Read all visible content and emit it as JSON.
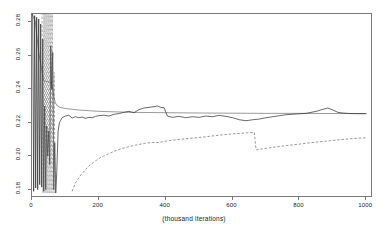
{
  "figure": {
    "background": "#ffffff",
    "frame_color": "#7a7a7a"
  },
  "chart_data": {
    "type": "line",
    "title": "",
    "subtitle": "",
    "xlabel": "(thousand iterations)",
    "ylabel": "",
    "xlim": [
      0,
      1020
    ],
    "ylim": [
      0.175,
      0.285
    ],
    "grid": false,
    "legend": null,
    "xticks": [
      0,
      200,
      400,
      600,
      800,
      1000
    ],
    "xtick_labels": [
      "0",
      "200",
      "400",
      "600",
      "800",
      "1000"
    ],
    "yticks": [
      0.18,
      0.2,
      0.22,
      0.24,
      0.26,
      0.28
    ],
    "ytick_labels": [
      "0.18",
      "0.20",
      "0.22",
      "0.24",
      "0.26",
      "0.28"
    ],
    "series": [
      {
        "name": "reference-level",
        "style": "solid",
        "color": "#555555",
        "width": 0.6,
        "description": "flat horizontal reference trace settling near 0.2255",
        "x": [
          0,
          10,
          20,
          28,
          34,
          40,
          46,
          52,
          58,
          62,
          66,
          70,
          76,
          84,
          92,
          100,
          140,
          200,
          300,
          400,
          500,
          600,
          700,
          800,
          900,
          1000
        ],
        "y": [
          0.285,
          0.2805,
          0.262,
          0.253,
          0.2455,
          0.2448,
          0.2445,
          0.2442,
          0.244,
          0.24,
          0.235,
          0.2318,
          0.23,
          0.2292,
          0.2288,
          0.2285,
          0.2276,
          0.2268,
          0.2262,
          0.226,
          0.2258,
          0.2257,
          0.2256,
          0.2256,
          0.2255,
          0.2255
        ]
      },
      {
        "name": "noisy-upper-chain",
        "style": "solid-jagged",
        "color": "#2a2a2a",
        "width": 0.7,
        "description": "highly oscillatory chain, burn-in spikes before x=70, rising to plateau ~0.2255 with bumps near 370 and 880",
        "x": [
          2,
          5,
          8,
          11,
          14,
          17,
          20,
          23,
          26,
          29,
          32,
          35,
          38,
          41,
          44,
          47,
          50,
          53,
          56,
          59,
          62,
          65,
          68,
          71,
          74,
          78,
          82,
          86,
          90,
          95,
          100,
          110,
          120,
          130,
          140,
          150,
          160,
          170,
          180,
          190,
          200,
          215,
          230,
          245,
          260,
          275,
          290,
          305,
          320,
          335,
          350,
          365,
          375,
          385,
          395,
          405,
          420,
          440,
          460,
          480,
          500,
          520,
          540,
          560,
          580,
          600,
          620,
          640,
          660,
          680,
          700,
          720,
          740,
          760,
          790,
          820,
          850,
          870,
          885,
          900,
          915,
          930,
          950,
          970,
          1000
        ],
        "y": [
          0.286,
          0.179,
          0.284,
          0.181,
          0.283,
          0.18,
          0.282,
          0.183,
          0.279,
          0.1815,
          0.27,
          0.179,
          0.23,
          0.18,
          0.218,
          0.2,
          0.215,
          0.195,
          0.266,
          0.24,
          0.262,
          0.18,
          0.208,
          0.178,
          0.19,
          0.215,
          0.22,
          0.2215,
          0.223,
          0.2235,
          0.224,
          0.2245,
          0.2228,
          0.2236,
          0.223,
          0.2234,
          0.2226,
          0.2232,
          0.223,
          0.2238,
          0.2242,
          0.2245,
          0.224,
          0.225,
          0.2255,
          0.2262,
          0.2268,
          0.226,
          0.2278,
          0.2288,
          0.2292,
          0.2296,
          0.23,
          0.2292,
          0.229,
          0.224,
          0.2232,
          0.2238,
          0.223,
          0.2236,
          0.2232,
          0.224,
          0.2236,
          0.2244,
          0.2238,
          0.223,
          0.2218,
          0.2212,
          0.2218,
          0.2222,
          0.223,
          0.2236,
          0.2242,
          0.2248,
          0.2252,
          0.2256,
          0.2268,
          0.228,
          0.2288,
          0.2276,
          0.2262,
          0.2258,
          0.2255,
          0.2254,
          0.2254
        ]
      },
      {
        "name": "dashed-lower-chain",
        "style": "dashed",
        "color": "#555555",
        "width": 0.6,
        "description": "slowly rising dashed chain from ~0.185 with a sharp downward jump at x=670, then recovering",
        "x": [
          120,
          130,
          145,
          160,
          175,
          190,
          205,
          220,
          240,
          260,
          280,
          300,
          320,
          340,
          360,
          380,
          400,
          420,
          440,
          460,
          480,
          500,
          520,
          545,
          570,
          595,
          620,
          645,
          665,
          670,
          672,
          690,
          710,
          740,
          770,
          800,
          830,
          860,
          890,
          920,
          950,
          980,
          1000
        ],
        "y": [
          0.179,
          0.184,
          0.1885,
          0.192,
          0.195,
          0.1972,
          0.1992,
          0.2006,
          0.2024,
          0.204,
          0.2052,
          0.2062,
          0.207,
          0.2078,
          0.2082,
          0.2082,
          0.209,
          0.2096,
          0.21,
          0.2104,
          0.2108,
          0.2112,
          0.2116,
          0.2122,
          0.2128,
          0.2132,
          0.2136,
          0.214,
          0.2142,
          0.204,
          0.2038,
          0.2044,
          0.205,
          0.2058,
          0.2066,
          0.2072,
          0.208,
          0.2086,
          0.2092,
          0.2098,
          0.2104,
          0.2108,
          0.211
        ]
      },
      {
        "name": "dashed-burnin-spikes",
        "style": "dashed",
        "color": "#666666",
        "width": 0.6,
        "description": "vertical dashed burn-in excursions between x=30 and x=70",
        "x": [
          30,
          33,
          36,
          39,
          42,
          45,
          48,
          51,
          54,
          57,
          60,
          63,
          66,
          69,
          72
        ],
        "y": [
          0.286,
          0.178,
          0.286,
          0.178,
          0.286,
          0.178,
          0.286,
          0.178,
          0.286,
          0.178,
          0.286,
          0.178,
          0.25,
          0.178,
          0.19
        ]
      }
    ]
  },
  "axis": {
    "x_title": "(thousand iterations)"
  }
}
